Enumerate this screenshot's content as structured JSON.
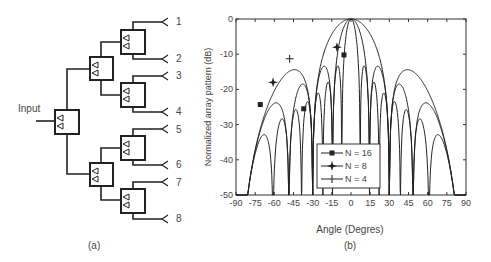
{
  "figure_a": {
    "input_label": "Input",
    "output_labels": [
      "1",
      "2",
      "3",
      "4",
      "5",
      "6",
      "7",
      "8"
    ],
    "caption": "(a)"
  },
  "figure_b": {
    "caption": "(b)"
  },
  "chart_data": {
    "type": "line",
    "title": "",
    "xlabel": "Angle (Degres)",
    "ylabel": "Normalized array pattern (dB)",
    "xlim": [
      -90,
      90
    ],
    "ylim": [
      -50,
      0
    ],
    "xticks": [
      "-90",
      "-75",
      "-60",
      "-45",
      "-30",
      "-15",
      "0",
      "15",
      "30",
      "45",
      "60",
      "75",
      "90"
    ],
    "yticks": [
      "0",
      "-10",
      "-20",
      "-30",
      "-40",
      "-50"
    ],
    "grid": false,
    "legend_position": "lower center",
    "series": [
      {
        "name": "N = 16",
        "marker": "square",
        "sidelobe_peaks_db": [
          -10.2,
          -25.5,
          -24.3
        ],
        "sidelobe_peak_angles": [
          -5.5,
          -37,
          -71
        ]
      },
      {
        "name": "N = 8",
        "marker": "star",
        "sidelobe_peaks_db": [
          -8,
          -18
        ],
        "sidelobe_peak_angles": [
          -11,
          -61
        ]
      },
      {
        "name": "N = 4",
        "marker": "plus",
        "sidelobe_peaks_db": [
          -11.3
        ],
        "sidelobe_peak_angles": [
          -48
        ]
      }
    ]
  }
}
